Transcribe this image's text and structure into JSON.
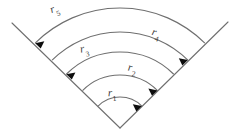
{
  "figure": {
    "type": "sector-annulus-diagram",
    "background_color": "#ffffff",
    "line_color": "#6f6f6f",
    "arrow_color": "#0d0d0d",
    "label_color": "#3a3a3a",
    "apex": {
      "x": 120,
      "y": 128
    },
    "sector_half_angle_degrees": 45,
    "labels": [
      {
        "id": "r1",
        "base": "r",
        "subscript": "1"
      },
      {
        "id": "r2",
        "base": "r",
        "subscript": "2"
      },
      {
        "id": "r3",
        "base": "r",
        "subscript": "3"
      },
      {
        "id": "r4",
        "base": "r",
        "subscript": "4"
      },
      {
        "id": "r5",
        "base": "r",
        "subscript": "5"
      }
    ],
    "rays": [
      {
        "id": "left-ray",
        "from": {
          "x": 120,
          "y": 128
        },
        "to": {
          "x": 12,
          "y": 23
        }
      },
      {
        "id": "right-ray",
        "from": {
          "x": 120,
          "y": 128
        },
        "to": {
          "x": 228,
          "y": 22
        }
      }
    ],
    "arcs": [
      {
        "id": "arc-r1",
        "radius": 31,
        "arrow_end": "right"
      },
      {
        "id": "arc-r2",
        "radius": 53,
        "arrow_end": "right"
      },
      {
        "id": "arc-r3",
        "radius": 76,
        "arrow_end": "left"
      },
      {
        "id": "arc-r4",
        "radius": 96,
        "arrow_end": "right"
      },
      {
        "id": "arc-r5",
        "radius": 120,
        "arrow_end": "left"
      }
    ]
  }
}
